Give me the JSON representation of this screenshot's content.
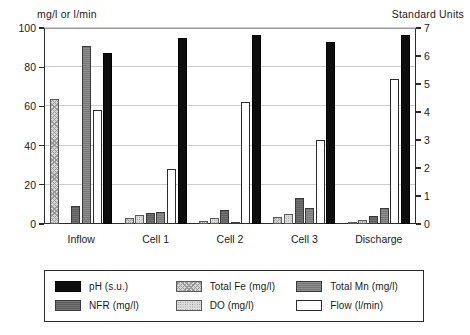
{
  "header": {
    "left_axis_unit": "mg/l or l/min",
    "right_axis_unit": "Standard Units"
  },
  "axes": {
    "left_ticks": [
      "100",
      "80",
      "60",
      "40",
      "20",
      "0"
    ],
    "right_ticks": [
      "7",
      "6",
      "5",
      "4",
      "3",
      "2",
      "1",
      "0"
    ]
  },
  "legend": {
    "items": [
      {
        "label": "pH (s.u.)",
        "key": "ph",
        "swatch": "f-ph"
      },
      {
        "label": "Total Fe (mg/l)",
        "key": "fe",
        "swatch": "f-fe"
      },
      {
        "label": "Total Mn (mg/l)",
        "key": "mn",
        "swatch": "f-mn"
      },
      {
        "label": "NFR (mg/l)",
        "key": "nfr",
        "swatch": "f-nfr"
      },
      {
        "label": "DO (mg/l)",
        "key": "do",
        "swatch": "f-do"
      },
      {
        "label": "Flow (l/min)",
        "key": "flow",
        "swatch": "f-flow"
      }
    ]
  },
  "chart_data": {
    "type": "bar",
    "title": "",
    "xlabel": "",
    "ylabel": "mg/l or l/min",
    "ylabel_right": "Standard Units",
    "ylim": [
      0,
      100
    ],
    "ylim_right": [
      0,
      7
    ],
    "grid": true,
    "legend_position": "bottom",
    "categories": [
      "Inflow",
      "Cell 1",
      "Cell 2",
      "Cell 3",
      "Discharge"
    ],
    "bar_order": [
      "fe",
      "do",
      "nfr",
      "mn",
      "flow",
      "ph"
    ],
    "series": [
      {
        "name": "Total Fe (mg/l)",
        "key": "fe",
        "axis": "left",
        "values": [
          64.0,
          3.0,
          1.6,
          3.5,
          1.0
        ]
      },
      {
        "name": "DO (mg/l)",
        "key": "do",
        "axis": "left",
        "values": [
          0.0,
          4.5,
          3.2,
          5.2,
          2.2
        ]
      },
      {
        "name": "NFR (mg/l)",
        "key": "nfr",
        "axis": "left",
        "values": [
          9.0,
          5.5,
          7.0,
          13.5,
          4.0
        ]
      },
      {
        "name": "Total Mn (mg/l)",
        "key": "mn",
        "axis": "left",
        "values": [
          91.0,
          6.0,
          0.6,
          8.0,
          8.0
        ]
      },
      {
        "name": "Flow (l/min)",
        "key": "flow",
        "axis": "left",
        "values": [
          58.0,
          28.0,
          62.0,
          43.0,
          74.0
        ]
      },
      {
        "name": "pH (s.u.)",
        "key": "ph",
        "axis": "right",
        "values": [
          6.1,
          6.65,
          6.75,
          6.5,
          6.75
        ]
      }
    ],
    "ph_left_scale_equivalent": [
      87.0,
      95.0,
      96.5,
      93.0,
      96.5
    ]
  }
}
